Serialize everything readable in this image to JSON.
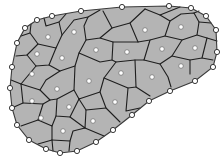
{
  "diagram": {
    "type": "voronoi-tessellation",
    "colors": {
      "cell_fill": "#b4b4b4",
      "edge": "#1e1e1e",
      "point_fill": "#ffffff",
      "background": "#ffffff"
    },
    "boundary_points": [
      [
        52,
        16
      ],
      [
        81,
        11
      ],
      [
        122,
        7
      ],
      [
        169,
        6
      ],
      [
        191,
        8
      ],
      [
        206,
        16
      ],
      [
        216,
        30
      ],
      [
        217,
        52
      ],
      [
        213,
        67
      ],
      [
        195,
        81
      ],
      [
        170,
        91
      ],
      [
        149,
        101
      ],
      [
        132,
        115
      ],
      [
        113,
        130
      ],
      [
        96,
        142
      ],
      [
        77,
        151
      ],
      [
        60,
        153
      ],
      [
        46,
        149
      ],
      [
        29,
        140
      ],
      [
        17,
        125
      ],
      [
        12,
        108
      ],
      [
        10,
        88
      ],
      [
        12,
        67
      ],
      [
        17,
        43
      ],
      [
        25,
        28
      ],
      [
        37,
        20
      ]
    ],
    "interior_points": [
      [
        48,
        37
      ],
      [
        74,
        32
      ],
      [
        96,
        50
      ],
      [
        145,
        30
      ],
      [
        181,
        27
      ],
      [
        37,
        54
      ],
      [
        62,
        58
      ],
      [
        127,
        52
      ],
      [
        162,
        49
      ],
      [
        195,
        48
      ],
      [
        32,
        74
      ],
      [
        89,
        81
      ],
      [
        121,
        73
      ],
      [
        152,
        77
      ],
      [
        181,
        66
      ],
      [
        57,
        89
      ],
      [
        115,
        102
      ],
      [
        32,
        101
      ],
      [
        69,
        107
      ],
      [
        41,
        118
      ],
      [
        93,
        121
      ],
      [
        63,
        131
      ]
    ]
  }
}
